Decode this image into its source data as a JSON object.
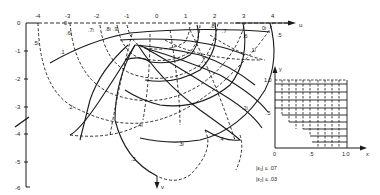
{
  "figure": {
    "u_axis": {
      "label": "u",
      "ticks": [
        "-4",
        "-3",
        "-2",
        "-1",
        "0",
        "1",
        "2",
        "3",
        "4"
      ]
    },
    "v_axis": {
      "label": "v",
      "ticks": [
        "0",
        "-1",
        "-2",
        "-3",
        "-4",
        "-5",
        "-6"
      ]
    },
    "curve_labels": {
      "solid": [
        ".1",
        ".2",
        ".3",
        ".4",
        ".5",
        ".6",
        ".7",
        ".8"
      ],
      "dashed": [
        ".5i",
        ".6i",
        ".7i",
        ".8i",
        ".9i",
        "0",
        "0i",
        ".4i",
        ".3i",
        ".2i",
        ".1i"
      ]
    },
    "label_text": {
      "l_5i": ".5i",
      "l_6i": ".6i",
      "l_7i": ".7i",
      "l_8i": ".8i",
      "l_9i": ".9i",
      "l_0": "0",
      "l_0i": "0i",
      "l_1": ".1",
      "l_2": ".2",
      "l_3": ".3",
      "l_4": ".4",
      "l_5": ".5",
      "l_6": ".6",
      "l_7": ".7",
      "l_8": ".8",
      "l_4i": ".4i",
      "l_3i": ".3i",
      "l_2i": ".2i",
      "l_1i": ".1i"
    }
  },
  "inset": {
    "x_axis": {
      "label": "x",
      "ticks": [
        "0",
        ".5",
        "1.0"
      ]
    },
    "y_axis": {
      "label": "y",
      "ticks": [
        ".5",
        "1.0"
      ]
    }
  },
  "error_bounds": {
    "eps1": "|ε₁| ≤ .07",
    "eps2": "|ε₂| ≤ .03"
  }
}
